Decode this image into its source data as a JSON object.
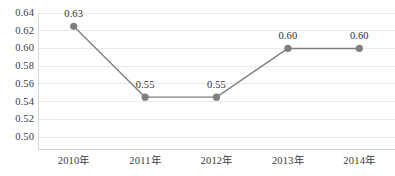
{
  "chart_data": {
    "type": "line",
    "title": "",
    "subtitle": "",
    "xlabel": "",
    "ylabel": "",
    "categories": [
      "2010年",
      "2011年",
      "2012年",
      "2013年",
      "2014年"
    ],
    "values": [
      0.63,
      0.55,
      0.55,
      0.6,
      0.6
    ],
    "plotted_values": [
      0.625,
      0.545,
      0.545,
      0.6,
      0.6
    ],
    "data_labels": [
      "0.63",
      "0.55",
      "0.55",
      "0.60",
      "0.60"
    ],
    "ylim": [
      0.5,
      0.64
    ],
    "ytick_step": 0.02,
    "ytick_labels": [
      "0.64",
      "0.62",
      "0.60",
      "0.58",
      "0.56",
      "0.54",
      "0.52",
      "0.50"
    ],
    "ytick_values": [
      0.64,
      0.62,
      0.6,
      0.58,
      0.56,
      0.54,
      0.52,
      0.5
    ],
    "grid": true,
    "grid_axis": "y",
    "legend": false,
    "legend_position": "none",
    "series": [
      {
        "name": "",
        "values": [
          0.63,
          0.55,
          0.55,
          0.6,
          0.6
        ]
      }
    ],
    "colors": {
      "line": "#808080",
      "marker": "#7f7f7f",
      "gridline": "#e9e9e9",
      "axis": "#d0d0d0",
      "tick_text": "#3b3b3b",
      "label_text": "#2f2f2f",
      "background": "#ffffff"
    },
    "style": {
      "line_width": 1.4,
      "marker_radius": 3.6,
      "marker_shape": "circle",
      "data_labels_position": "above"
    }
  }
}
